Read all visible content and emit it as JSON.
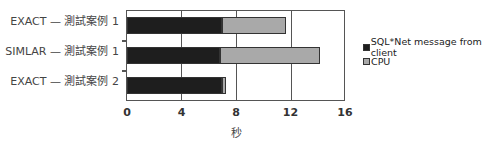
{
  "chart_data": {
    "type": "bar",
    "orientation": "horizontal",
    "stacked": true,
    "title": "",
    "categories": [
      "EXACT — 測試案例 1",
      "SIMLAR — 測試案例 1",
      "EXACT — 測試案例 2"
    ],
    "series": [
      {
        "name": "SQL*Net message from client",
        "color": "#1e1e1e",
        "values": [
          7.0,
          6.9,
          7.0
        ]
      },
      {
        "name": "CPU",
        "color": "#a9a9a9",
        "values": [
          4.8,
          7.4,
          0.35
        ]
      }
    ],
    "totals": [
      11.8,
      14.3,
      7.35
    ],
    "xlabel": "秒",
    "ylabel": "",
    "xlim": [
      0,
      16
    ],
    "xticks": [
      "0",
      "4",
      "8",
      "12",
      "16"
    ],
    "grid": true,
    "legend_position": "right"
  }
}
